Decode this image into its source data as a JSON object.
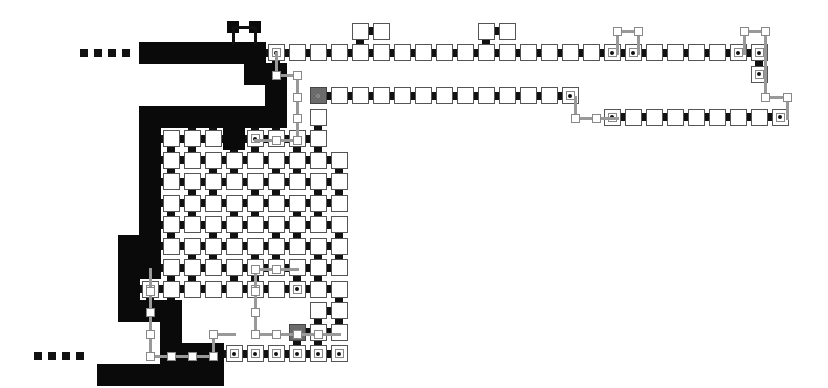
{
  "diagram": {
    "title": "",
    "grid": {
      "origin_x": 171,
      "origin_y": 31,
      "pitch_x": 21,
      "pitch_y": 21.5,
      "cell_size": 17
    },
    "colors": {
      "background": "#ffffff",
      "cell_border": "#555555",
      "path_black": "#0a0a0a",
      "start_gray": "#6b6b6b",
      "wire": "#999999"
    },
    "dotted_lines": [
      {
        "name": "top-entry-dots",
        "y": 53,
        "xs": [
          84,
          98,
          112,
          126
        ]
      },
      {
        "name": "bottom-entry-dots",
        "y": 356,
        "xs": [
          38,
          52,
          66,
          80
        ]
      }
    ],
    "cells": [
      {
        "c": -1,
        "r": 1,
        "t": "black"
      },
      {
        "c": 0,
        "r": 1,
        "t": "black"
      },
      {
        "c": 1,
        "r": 1,
        "t": "black"
      },
      {
        "c": 2,
        "r": 1,
        "t": "black"
      },
      {
        "c": 3,
        "r": 1,
        "t": "black"
      },
      {
        "c": 4,
        "r": 1,
        "t": "black"
      },
      {
        "c": 5,
        "r": 1,
        "t": "dot"
      },
      {
        "c": 6,
        "r": 1,
        "t": "white"
      },
      {
        "c": 7,
        "r": 1,
        "t": "white"
      },
      {
        "c": 8,
        "r": 1,
        "t": "white"
      },
      {
        "c": 9,
        "r": 1,
        "t": "white"
      },
      {
        "c": 10,
        "r": 1,
        "t": "white"
      },
      {
        "c": 11,
        "r": 1,
        "t": "white"
      },
      {
        "c": 12,
        "r": 1,
        "t": "white"
      },
      {
        "c": 13,
        "r": 1,
        "t": "white"
      },
      {
        "c": 14,
        "r": 1,
        "t": "white"
      },
      {
        "c": 15,
        "r": 1,
        "t": "white"
      },
      {
        "c": 16,
        "r": 1,
        "t": "white"
      },
      {
        "c": 17,
        "r": 1,
        "t": "white"
      },
      {
        "c": 18,
        "r": 1,
        "t": "white"
      },
      {
        "c": 19,
        "r": 1,
        "t": "white"
      },
      {
        "c": 20,
        "r": 1,
        "t": "white"
      },
      {
        "c": 21,
        "r": 1,
        "t": "dot"
      },
      {
        "c": 22,
        "r": 1,
        "t": "dot"
      },
      {
        "c": 23,
        "r": 1,
        "t": "white"
      },
      {
        "c": 24,
        "r": 1,
        "t": "white"
      },
      {
        "c": 25,
        "r": 1,
        "t": "white"
      },
      {
        "c": 26,
        "r": 1,
        "t": "white"
      },
      {
        "c": 27,
        "r": 1,
        "t": "dot"
      },
      {
        "c": 28,
        "r": 1,
        "t": "dot"
      },
      {
        "c": 9,
        "r": 0,
        "t": "white"
      },
      {
        "c": 10,
        "r": 0,
        "t": "white"
      },
      {
        "c": 15,
        "r": 0,
        "t": "white"
      },
      {
        "c": 16,
        "r": 0,
        "t": "white"
      },
      {
        "c": 4,
        "r": 2,
        "t": "black"
      },
      {
        "c": 5,
        "r": 2,
        "t": "black"
      },
      {
        "c": 7,
        "r": 3,
        "t": "gray"
      },
      {
        "c": 8,
        "r": 3,
        "t": "white"
      },
      {
        "c": 9,
        "r": 3,
        "t": "white"
      },
      {
        "c": 10,
        "r": 3,
        "t": "white"
      },
      {
        "c": 11,
        "r": 3,
        "t": "white"
      },
      {
        "c": 12,
        "r": 3,
        "t": "white"
      },
      {
        "c": 13,
        "r": 3,
        "t": "white"
      },
      {
        "c": 14,
        "r": 3,
        "t": "white"
      },
      {
        "c": 15,
        "r": 3,
        "t": "white"
      },
      {
        "c": 16,
        "r": 3,
        "t": "white"
      },
      {
        "c": 17,
        "r": 3,
        "t": "white"
      },
      {
        "c": 18,
        "r": 3,
        "t": "white"
      },
      {
        "c": 19,
        "r": 3,
        "t": "dot"
      },
      {
        "c": 28,
        "r": 2,
        "t": "dot"
      },
      {
        "c": 21,
        "r": 4,
        "t": "dot"
      },
      {
        "c": 22,
        "r": 4,
        "t": "white"
      },
      {
        "c": 23,
        "r": 4,
        "t": "white"
      },
      {
        "c": 24,
        "r": 4,
        "t": "white"
      },
      {
        "c": 25,
        "r": 4,
        "t": "white"
      },
      {
        "c": 26,
        "r": 4,
        "t": "white"
      },
      {
        "c": 27,
        "r": 4,
        "t": "white"
      },
      {
        "c": 28,
        "r": 4,
        "t": "white"
      },
      {
        "c": 29,
        "r": 4,
        "t": "dot"
      },
      {
        "c": 5,
        "r": 3,
        "t": "black"
      },
      {
        "c": -1,
        "r": 4,
        "t": "black"
      },
      {
        "c": 0,
        "r": 4,
        "t": "black"
      },
      {
        "c": 1,
        "r": 4,
        "t": "black"
      },
      {
        "c": 2,
        "r": 4,
        "t": "black"
      },
      {
        "c": 3,
        "r": 4,
        "t": "black"
      },
      {
        "c": 4,
        "r": 4,
        "t": "black"
      },
      {
        "c": 5,
        "r": 4,
        "t": "black"
      },
      {
        "c": 7,
        "r": 4,
        "t": "white"
      },
      {
        "c": -1,
        "r": 5,
        "t": "black"
      },
      {
        "c": 0,
        "r": 5,
        "t": "white"
      },
      {
        "c": 1,
        "r": 5,
        "t": "white"
      },
      {
        "c": 2,
        "r": 5,
        "t": "white"
      },
      {
        "c": 3,
        "r": 5,
        "t": "black"
      },
      {
        "c": 4,
        "r": 5,
        "t": "dot"
      },
      {
        "c": 5,
        "r": 5,
        "t": "white"
      },
      {
        "c": 6,
        "r": 5,
        "t": "white"
      },
      {
        "c": 7,
        "r": 5,
        "t": "white"
      },
      {
        "c": -1,
        "r": 6,
        "t": "black"
      },
      {
        "c": 0,
        "r": 6,
        "t": "white"
      },
      {
        "c": 1,
        "r": 6,
        "t": "white"
      },
      {
        "c": 2,
        "r": 6,
        "t": "white"
      },
      {
        "c": 3,
        "r": 6,
        "t": "white"
      },
      {
        "c": 4,
        "r": 6,
        "t": "white"
      },
      {
        "c": 5,
        "r": 6,
        "t": "white"
      },
      {
        "c": 6,
        "r": 6,
        "t": "white"
      },
      {
        "c": 7,
        "r": 6,
        "t": "white"
      },
      {
        "c": 8,
        "r": 6,
        "t": "white"
      },
      {
        "c": -1,
        "r": 7,
        "t": "black"
      },
      {
        "c": 0,
        "r": 7,
        "t": "white"
      },
      {
        "c": 1,
        "r": 7,
        "t": "white"
      },
      {
        "c": 2,
        "r": 7,
        "t": "white"
      },
      {
        "c": 3,
        "r": 7,
        "t": "white"
      },
      {
        "c": 4,
        "r": 7,
        "t": "white"
      },
      {
        "c": 5,
        "r": 7,
        "t": "white"
      },
      {
        "c": 6,
        "r": 7,
        "t": "white"
      },
      {
        "c": 7,
        "r": 7,
        "t": "white"
      },
      {
        "c": 8,
        "r": 7,
        "t": "white"
      },
      {
        "c": -1,
        "r": 8,
        "t": "black"
      },
      {
        "c": 0,
        "r": 8,
        "t": "white"
      },
      {
        "c": 1,
        "r": 8,
        "t": "white"
      },
      {
        "c": 2,
        "r": 8,
        "t": "white"
      },
      {
        "c": 3,
        "r": 8,
        "t": "white"
      },
      {
        "c": 4,
        "r": 8,
        "t": "white"
      },
      {
        "c": 5,
        "r": 8,
        "t": "white"
      },
      {
        "c": 6,
        "r": 8,
        "t": "white"
      },
      {
        "c": 7,
        "r": 8,
        "t": "white"
      },
      {
        "c": 8,
        "r": 8,
        "t": "white"
      },
      {
        "c": -1,
        "r": 9,
        "t": "black"
      },
      {
        "c": 0,
        "r": 9,
        "t": "white"
      },
      {
        "c": 1,
        "r": 9,
        "t": "white"
      },
      {
        "c": 2,
        "r": 9,
        "t": "white"
      },
      {
        "c": 3,
        "r": 9,
        "t": "white"
      },
      {
        "c": 4,
        "r": 9,
        "t": "white"
      },
      {
        "c": 5,
        "r": 9,
        "t": "white"
      },
      {
        "c": 6,
        "r": 9,
        "t": "white"
      },
      {
        "c": 7,
        "r": 9,
        "t": "white"
      },
      {
        "c": 8,
        "r": 9,
        "t": "white"
      },
      {
        "c": -1,
        "r": 10,
        "t": "black"
      },
      {
        "c": 0,
        "r": 10,
        "t": "white"
      },
      {
        "c": 1,
        "r": 10,
        "t": "white"
      },
      {
        "c": 2,
        "r": 10,
        "t": "white"
      },
      {
        "c": 3,
        "r": 10,
        "t": "white"
      },
      {
        "c": 4,
        "r": 10,
        "t": "white"
      },
      {
        "c": 5,
        "r": 10,
        "t": "white"
      },
      {
        "c": 6,
        "r": 10,
        "t": "white"
      },
      {
        "c": 7,
        "r": 10,
        "t": "white"
      },
      {
        "c": 8,
        "r": 10,
        "t": "white"
      },
      {
        "c": -2,
        "r": 10,
        "t": "black"
      },
      {
        "c": -2,
        "r": 11,
        "t": "black"
      },
      {
        "c": -1,
        "r": 11,
        "t": "black"
      },
      {
        "c": 0,
        "r": 11,
        "t": "white"
      },
      {
        "c": 1,
        "r": 11,
        "t": "white"
      },
      {
        "c": 2,
        "r": 11,
        "t": "white"
      },
      {
        "c": 3,
        "r": 11,
        "t": "white"
      },
      {
        "c": 4,
        "r": 11,
        "t": "white"
      },
      {
        "c": 5,
        "r": 11,
        "t": "white"
      },
      {
        "c": 6,
        "r": 11,
        "t": "white"
      },
      {
        "c": 7,
        "r": 11,
        "t": "white"
      },
      {
        "c": 8,
        "r": 11,
        "t": "white"
      },
      {
        "c": -2,
        "r": 12,
        "t": "black"
      },
      {
        "c": -1,
        "r": 12,
        "t": "dot"
      },
      {
        "c": 0,
        "r": 12,
        "t": "white"
      },
      {
        "c": 1,
        "r": 12,
        "t": "white"
      },
      {
        "c": 2,
        "r": 12,
        "t": "white"
      },
      {
        "c": 3,
        "r": 12,
        "t": "white"
      },
      {
        "c": 4,
        "r": 12,
        "t": "dot"
      },
      {
        "c": 5,
        "r": 12,
        "t": "white"
      },
      {
        "c": 6,
        "r": 12,
        "t": "dot"
      },
      {
        "c": 7,
        "r": 12,
        "t": "white"
      },
      {
        "c": 8,
        "r": 12,
        "t": "white"
      },
      {
        "c": -2,
        "r": 13,
        "t": "black"
      },
      {
        "c": -1,
        "r": 13,
        "t": "black"
      },
      {
        "c": 0,
        "r": 13,
        "t": "black"
      },
      {
        "c": 7,
        "r": 13,
        "t": "white"
      },
      {
        "c": 8,
        "r": 13,
        "t": "white"
      },
      {
        "c": 0,
        "r": 14,
        "t": "black"
      },
      {
        "c": 6,
        "r": 14,
        "t": "gray"
      },
      {
        "c": 7,
        "r": 14,
        "t": "white"
      },
      {
        "c": 8,
        "r": 14,
        "t": "white"
      },
      {
        "c": 0,
        "r": 15,
        "t": "black"
      },
      {
        "c": 1,
        "r": 15,
        "t": "black"
      },
      {
        "c": 2,
        "r": 15,
        "t": "black"
      },
      {
        "c": 3,
        "r": 15,
        "t": "dot"
      },
      {
        "c": 4,
        "r": 15,
        "t": "dot"
      },
      {
        "c": 5,
        "r": 15,
        "t": "dot"
      },
      {
        "c": 6,
        "r": 15,
        "t": "dot"
      },
      {
        "c": 7,
        "r": 15,
        "t": "dot"
      },
      {
        "c": 8,
        "r": 15,
        "t": "dot"
      },
      {
        "c": -3,
        "r": 16,
        "t": "black"
      },
      {
        "c": -2,
        "r": 16,
        "t": "black"
      },
      {
        "c": -1,
        "r": 16,
        "t": "black"
      },
      {
        "c": 0,
        "r": 16,
        "t": "black"
      },
      {
        "c": 1,
        "r": 16,
        "t": "black"
      },
      {
        "c": 2,
        "r": 16,
        "t": "black"
      }
    ],
    "small_black_boxes": [
      {
        "x": 233,
        "y": 27
      },
      {
        "x": 255,
        "y": 27
      }
    ],
    "wires": [
      {
        "pts": [
          [
            276,
            53
          ],
          [
            276,
            75
          ],
          [
            297,
            75
          ],
          [
            297,
            140
          ]
        ]
      },
      {
        "pts": [
          [
            255,
            140
          ],
          [
            297,
            140
          ]
        ]
      },
      {
        "pts": [
          [
            617,
            31
          ],
          [
            638,
            31
          ]
        ]
      },
      {
        "pts": [
          [
            617,
            31
          ],
          [
            617,
            53
          ]
        ]
      },
      {
        "pts": [
          [
            638,
            31
          ],
          [
            638,
            53
          ]
        ]
      },
      {
        "pts": [
          [
            744,
            31
          ],
          [
            765,
            31
          ]
        ]
      },
      {
        "pts": [
          [
            744,
            31
          ],
          [
            744,
            53
          ]
        ]
      },
      {
        "pts": [
          [
            765,
            31
          ],
          [
            765,
            53
          ]
        ]
      },
      {
        "pts": [
          [
            765,
            53
          ],
          [
            765,
            97
          ],
          [
            787,
            97
          ],
          [
            787,
            118
          ]
        ]
      },
      {
        "pts": [
          [
            575,
            97
          ],
          [
            575,
            118
          ],
          [
            617,
            118
          ]
        ]
      },
      {
        "pts": [
          [
            150,
            269
          ],
          [
            150,
            356
          ],
          [
            213,
            356
          ],
          [
            213,
            334
          ],
          [
            234,
            334
          ]
        ]
      },
      {
        "pts": [
          [
            255,
            269
          ],
          [
            297,
            269
          ]
        ]
      },
      {
        "pts": [
          [
            255,
            269
          ],
          [
            255,
            334
          ],
          [
            339,
            334
          ]
        ]
      }
    ],
    "wire_nodes": [
      {
        "x": 276,
        "y": 75
      },
      {
        "x": 297,
        "y": 75
      },
      {
        "x": 297,
        "y": 97
      },
      {
        "x": 297,
        "y": 118
      },
      {
        "x": 276,
        "y": 140
      },
      {
        "x": 297,
        "y": 140
      },
      {
        "x": 617,
        "y": 31
      },
      {
        "x": 638,
        "y": 31
      },
      {
        "x": 744,
        "y": 31
      },
      {
        "x": 765,
        "y": 31
      },
      {
        "x": 765,
        "y": 97
      },
      {
        "x": 787,
        "y": 97
      },
      {
        "x": 575,
        "y": 118
      },
      {
        "x": 596,
        "y": 118
      },
      {
        "x": 150,
        "y": 291
      },
      {
        "x": 150,
        "y": 312
      },
      {
        "x": 150,
        "y": 334
      },
      {
        "x": 150,
        "y": 356
      },
      {
        "x": 171,
        "y": 356
      },
      {
        "x": 192,
        "y": 356
      },
      {
        "x": 213,
        "y": 356
      },
      {
        "x": 213,
        "y": 334
      },
      {
        "x": 276,
        "y": 269
      },
      {
        "x": 255,
        "y": 269
      },
      {
        "x": 255,
        "y": 291
      },
      {
        "x": 255,
        "y": 312
      },
      {
        "x": 255,
        "y": 334
      },
      {
        "x": 276,
        "y": 334
      },
      {
        "x": 297,
        "y": 334
      },
      {
        "x": 318,
        "y": 334
      }
    ]
  }
}
